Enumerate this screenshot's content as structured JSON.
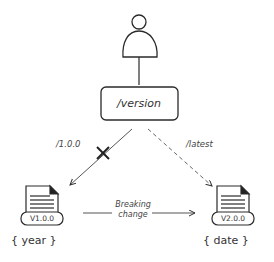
{
  "diagram": {
    "actor": {
      "name": "user"
    },
    "route": {
      "label": "/version"
    },
    "edges": [
      {
        "label": "/1.0.0",
        "from": "route",
        "to": "v1",
        "style": "solid",
        "blocked": true
      },
      {
        "label": "/latest",
        "from": "route",
        "to": "v2",
        "style": "dashed",
        "blocked": false
      },
      {
        "label": "Breaking change",
        "label_line1": "Breaking",
        "label_line2": "change",
        "from": "v1",
        "to": "v2",
        "style": "solid"
      }
    ],
    "versions": [
      {
        "id": "v1",
        "label": "V1.0.0",
        "param": "{ year }"
      },
      {
        "id": "v2",
        "label": "V2.0.0",
        "param": "{ date }"
      }
    ],
    "colors": {
      "stroke": "#2a2a2a",
      "background": "#ffffff"
    }
  }
}
